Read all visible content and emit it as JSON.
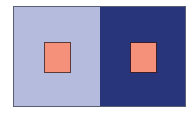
{
  "figure": {
    "panels": [
      {
        "name": "left",
        "background_color": "#b4bbdc",
        "square_color": "#f5907a"
      },
      {
        "name": "right",
        "background_color": "#28357a",
        "square_color": "#f5907a"
      }
    ]
  }
}
